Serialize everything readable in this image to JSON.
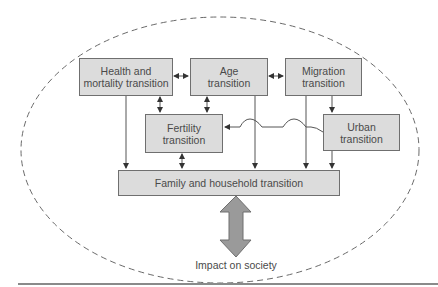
{
  "diagram": {
    "boxes": {
      "health": "Health and mortality transition",
      "age": "Age transition",
      "migration": "Migration transition",
      "fertility": "Fertility transition",
      "urban": "Urban transition",
      "family": "Family and household transition"
    },
    "box_lines": {
      "health": [
        "Health and",
        "mortality transition"
      ],
      "age": [
        "Age",
        "transition"
      ],
      "migration": [
        "Migration",
        "transition"
      ],
      "fertility": [
        "Fertility",
        "transition"
      ],
      "urban": [
        "Urban",
        "transition"
      ]
    },
    "outcome_label": "Impact on society",
    "colors": {
      "box_fill": "#dcdcdc",
      "box_border": "#6f6f6f",
      "text": "#4a4a4a",
      "big_arrow": "#9a9a9a",
      "dashed_ellipse": "#6a6a6a"
    },
    "connections": [
      {
        "from": "Health and mortality transition",
        "to": "Age transition",
        "type": "bidirectional"
      },
      {
        "from": "Age transition",
        "to": "Migration transition",
        "type": "bidirectional"
      },
      {
        "from": "Health and mortality transition",
        "to": "Fertility transition",
        "type": "bidirectional"
      },
      {
        "from": "Age transition",
        "to": "Fertility transition",
        "type": "bidirectional"
      },
      {
        "from": "Migration transition",
        "to": "Urban transition",
        "type": "directed"
      },
      {
        "from": "Urban transition",
        "to": "Fertility transition",
        "type": "directed"
      },
      {
        "from": "Health and mortality transition",
        "to": "Family and household transition",
        "type": "directed"
      },
      {
        "from": "Fertility transition",
        "to": "Family and household transition",
        "type": "bidirectional"
      },
      {
        "from": "Age transition",
        "to": "Family and household transition",
        "type": "directed"
      },
      {
        "from": "Migration transition",
        "to": "Family and household transition",
        "type": "directed"
      },
      {
        "from": "Urban transition",
        "to": "Family and household transition",
        "type": "directed"
      },
      {
        "from": "Family and household transition",
        "to": "Impact on society",
        "type": "bidirectional-large"
      }
    ]
  }
}
